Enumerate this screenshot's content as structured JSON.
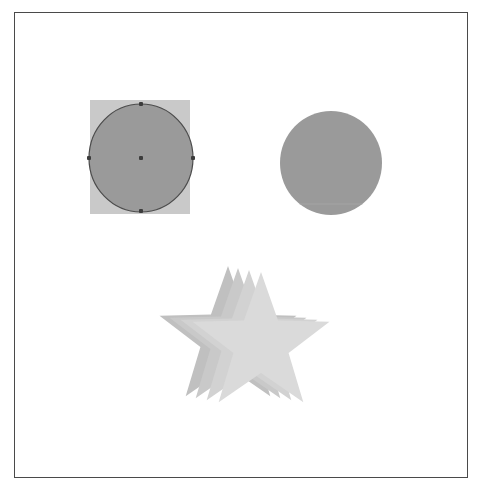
{
  "canvas": {
    "width": 483,
    "height": 494,
    "background_color": "#ffffff",
    "border_color": "#4a4a4a",
    "border": {
      "x": 14,
      "y": 12,
      "width": 454,
      "height": 466
    }
  },
  "shapes": [
    {
      "id": "selected-circle",
      "type": "ellipse",
      "label": "Selected Circle",
      "selected": true,
      "fill_color": "#9a9a9a",
      "stroke_color": "#4c4c4c",
      "center": {
        "x": 141,
        "y": 158
      },
      "radius": {
        "rx": 52,
        "ry": 54
      },
      "selection_box": {
        "fill_color": "#c9c9c9",
        "x": 90,
        "y": 100,
        "width": 100,
        "height": 114
      },
      "handles": [
        {
          "name": "handle-top",
          "x": 141,
          "y": 104
        },
        {
          "name": "handle-right",
          "x": 193,
          "y": 158
        },
        {
          "name": "handle-bottom",
          "x": 141,
          "y": 211
        },
        {
          "name": "handle-left",
          "x": 89,
          "y": 158
        },
        {
          "name": "handle-center",
          "x": 141,
          "y": 158
        }
      ]
    },
    {
      "id": "plain-circle",
      "type": "ellipse",
      "label": "Circle",
      "selected": false,
      "fill_color": "#9a9a9a",
      "stroke_color": "none",
      "center": {
        "x": 331,
        "y": 163
      },
      "radius": {
        "rx": 51,
        "ry": 52
      },
      "seam_line": {
        "color": "#a4a4a4",
        "y": 204
      }
    },
    {
      "id": "star-layer-1",
      "type": "star",
      "label": "Star Back Layer",
      "selected": false,
      "fill_color": "#c0c0c0",
      "points": 5,
      "center": {
        "x": 228,
        "y": 338
      },
      "outer_radius": 72,
      "inner_radius": 29,
      "rotation": -90
    },
    {
      "id": "star-layer-2",
      "type": "star",
      "label": "Star Middle Back Layer",
      "selected": false,
      "fill_color": "#c9c9c9",
      "points": 5,
      "center": {
        "x": 238,
        "y": 340
      },
      "outer_radius": 72,
      "inner_radius": 29,
      "rotation": -90
    },
    {
      "id": "star-layer-3",
      "type": "star",
      "label": "Star Middle Front Layer",
      "selected": false,
      "fill_color": "#d2d2d2",
      "points": 5,
      "center": {
        "x": 249,
        "y": 342
      },
      "outer_radius": 72,
      "inner_radius": 29,
      "rotation": -90
    },
    {
      "id": "star-layer-4",
      "type": "star",
      "label": "Star Front Layer",
      "selected": false,
      "fill_color": "#dadada",
      "points": 5,
      "center": {
        "x": 261,
        "y": 344
      },
      "outer_radius": 72,
      "inner_radius": 29,
      "rotation": -90
    }
  ]
}
